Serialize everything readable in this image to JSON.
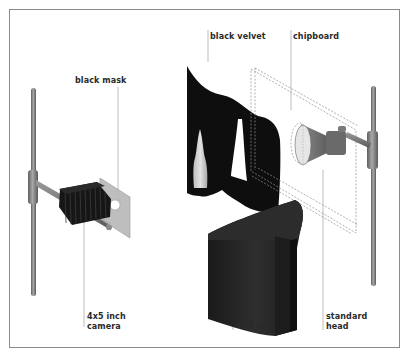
{
  "diagram": {
    "labels": {
      "black_mask": "black mask",
      "black_velvet": "black velvet",
      "chipboard": "chipboard",
      "camera_line1": "4x5 inch",
      "camera_line2": "camera",
      "soft_box": "soft box",
      "standard_head_line1": "standard",
      "standard_head_line2": "head"
    },
    "colors": {
      "frame": "#8a8a8a",
      "stand": "#7a7a7a",
      "velvet": "#111111",
      "softbox": "#222222",
      "mask": "#b9b9b9",
      "leader": "#9a9a9a",
      "text": "#2a2a2a"
    }
  }
}
